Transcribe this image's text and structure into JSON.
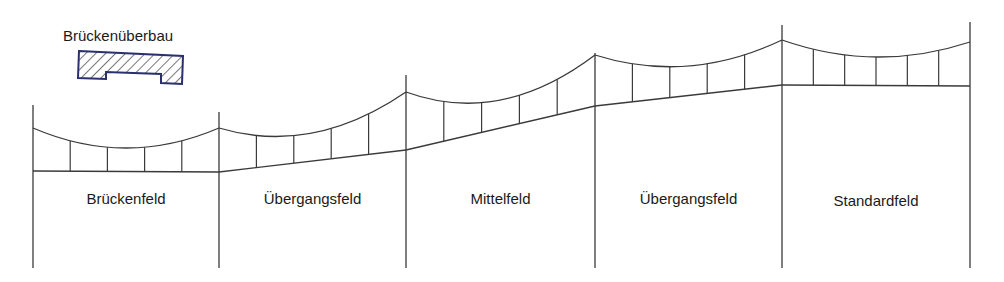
{
  "legend": {
    "title": "Brückenüberbau",
    "symbol": "deck-cross-section-hatched",
    "outline_color": "#2a2f6e",
    "hatch_color": "#555555"
  },
  "line_color": "#3a3a3a",
  "fields": [
    {
      "label": "Brückenfeld",
      "hangers": 4
    },
    {
      "label": "Übergangsfeld",
      "hangers": 4
    },
    {
      "label": "Mittelfeld",
      "hangers": 4
    },
    {
      "label": "Übergangsfeld",
      "hangers": 4
    },
    {
      "label": "Standardfeld",
      "hangers": 5
    }
  ]
}
